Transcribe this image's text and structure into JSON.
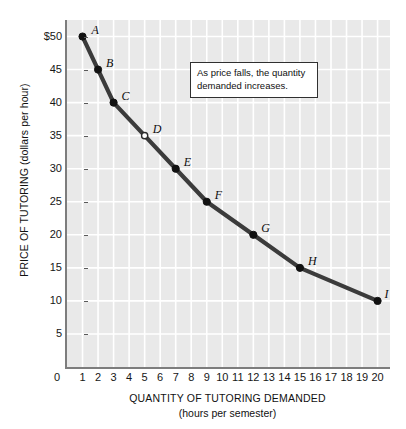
{
  "figure": {
    "background_color": "#ffffff",
    "plot_background_color": "#e9e9e9",
    "gridline_color": "#ffffff",
    "curve_color": "#3b3b3b",
    "marker_color": "#111111"
  },
  "annotation": {
    "text": "As price falls, the quantity demanded increases."
  },
  "axis": {
    "y_title": "PRICE OF TUTORING (dollars per hour)",
    "x_title": "QUANTITY OF TUTORING DEMANDED",
    "x_subtitle": "(hours per semester)"
  },
  "chart_data": {
    "type": "line",
    "title": "",
    "xlabel": "QUANTITY OF TUTORING DEMANDED (hours per semester)",
    "ylabel": "PRICE OF TUTORING (dollars per hour)",
    "xlim": [
      0,
      20.8
    ],
    "ylim": [
      0,
      52.5
    ],
    "grid": true,
    "legend": "none",
    "x_ticks": [
      0,
      1,
      2,
      3,
      4,
      5,
      6,
      7,
      8,
      9,
      10,
      11,
      12,
      13,
      14,
      15,
      16,
      17,
      18,
      19,
      20
    ],
    "x_tick_labels": [
      "0",
      "1",
      "2",
      "3",
      "4",
      "5",
      "6",
      "7",
      "8",
      "9",
      "10",
      "11",
      "12",
      "13",
      "14",
      "15",
      "16",
      "17",
      "18",
      "19",
      "20"
    ],
    "y_ticks": [
      5,
      10,
      15,
      20,
      25,
      30,
      35,
      40,
      45,
      50
    ],
    "y_tick_labels": [
      "5",
      "10",
      "15",
      "20",
      "25",
      "30",
      "35",
      "40",
      "45",
      "$50"
    ],
    "series": [
      {
        "name": "Demand",
        "x": [
          1,
          2,
          3,
          5,
          7,
          9,
          12,
          15,
          20
        ],
        "y": [
          50,
          45,
          40,
          35,
          30,
          25,
          20,
          15,
          10
        ]
      }
    ],
    "points": [
      {
        "label": "A",
        "x": 1,
        "y": 50,
        "marker": "filled",
        "label_dx": 9,
        "label_dy": -13
      },
      {
        "label": "B",
        "x": 2,
        "y": 45,
        "marker": "filled",
        "label_dx": 8,
        "label_dy": -13
      },
      {
        "label": "C",
        "x": 3,
        "y": 40,
        "marker": "filled",
        "label_dx": 8,
        "label_dy": -13
      },
      {
        "label": "D",
        "x": 5,
        "y": 35,
        "marker": "hollow",
        "label_dx": 8,
        "label_dy": -13
      },
      {
        "label": "E",
        "x": 7,
        "y": 30,
        "marker": "filled",
        "label_dx": 8,
        "label_dy": -13
      },
      {
        "label": "F",
        "x": 9,
        "y": 25,
        "marker": "filled",
        "label_dx": 8,
        "label_dy": -13
      },
      {
        "label": "G",
        "x": 12,
        "y": 20,
        "marker": "filled",
        "label_dx": 8,
        "label_dy": -13
      },
      {
        "label": "H",
        "x": 15,
        "y": 15,
        "marker": "filled",
        "label_dx": 8,
        "label_dy": -13
      },
      {
        "label": "I",
        "x": 20,
        "y": 10,
        "marker": "filled",
        "label_dx": 7,
        "label_dy": -13
      }
    ]
  }
}
